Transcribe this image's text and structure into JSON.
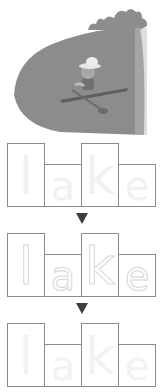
{
  "illustration": {
    "description": "child with hat paddling a kayak on a lake",
    "icon": "lake-kayak-illustration",
    "colors": {
      "water": "#8c8c8c",
      "trees": "#8a8a8a",
      "hat": "#e8e8e8"
    }
  },
  "word": "lake",
  "rows": [
    {
      "style": "outline",
      "letters": [
        "l",
        "a",
        "k",
        "e"
      ]
    },
    {
      "style": "dotted",
      "letters": [
        "l",
        "a",
        "k",
        "e"
      ]
    },
    {
      "style": "faint",
      "letters": [
        "l",
        "a",
        "k",
        "e"
      ]
    }
  ],
  "arrows": [
    "down-arrow",
    "down-arrow"
  ],
  "colors": {
    "box_border": "#8a8a8a",
    "arrow": "#3e3e3e"
  }
}
